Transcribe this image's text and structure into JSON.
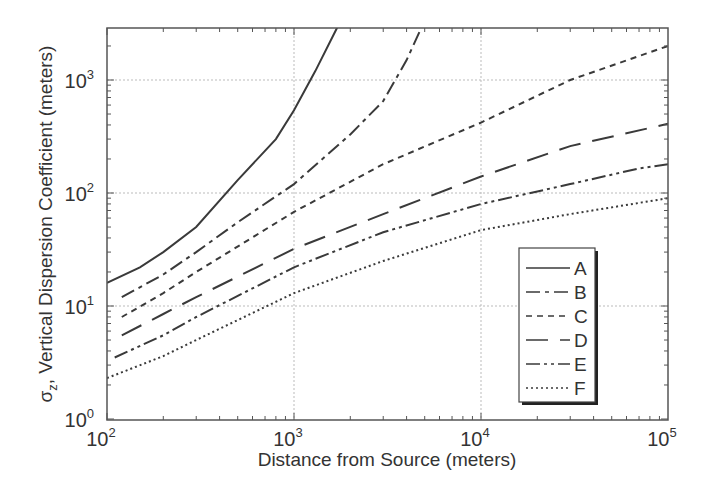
{
  "chart_data": {
    "type": "line",
    "title": "",
    "xlabel": "Distance from  Source (meters)",
    "ylabel": "σz, Vertical Dispersion Coefficient (meters)",
    "xscale": "log",
    "yscale": "log",
    "xlim": [
      100,
      100000
    ],
    "ylim": [
      1,
      2900
    ],
    "grid": true,
    "legend_position": "lower right",
    "x_ticks": [
      {
        "base": "10",
        "exp": "2",
        "value": 100
      },
      {
        "base": "10",
        "exp": "3",
        "value": 1000
      },
      {
        "base": "10",
        "exp": "4",
        "value": 10000
      },
      {
        "base": "10",
        "exp": "5",
        "value": 100000
      }
    ],
    "y_ticks": [
      {
        "base": "10",
        "exp": "0",
        "value": 1
      },
      {
        "base": "10",
        "exp": "1",
        "value": 10
      },
      {
        "base": "10",
        "exp": "2",
        "value": 100
      },
      {
        "base": "10",
        "exp": "3",
        "value": 1000
      }
    ],
    "series": [
      {
        "name": "A",
        "dash": "",
        "points": [
          [
            100,
            16
          ],
          [
            150,
            22
          ],
          [
            200,
            30
          ],
          [
            300,
            50
          ],
          [
            500,
            130
          ],
          [
            800,
            300
          ],
          [
            1000,
            540
          ],
          [
            1300,
            1200
          ],
          [
            1700,
            2900
          ]
        ]
      },
      {
        "name": "B",
        "dash": "14 5 4 5",
        "points": [
          [
            120,
            12
          ],
          [
            200,
            19
          ],
          [
            300,
            30
          ],
          [
            500,
            55
          ],
          [
            1000,
            120
          ],
          [
            2000,
            330
          ],
          [
            3000,
            650
          ],
          [
            4000,
            1500
          ],
          [
            4800,
            2900
          ]
        ]
      },
      {
        "name": "C",
        "dash": "6 5",
        "points": [
          [
            120,
            8
          ],
          [
            200,
            13
          ],
          [
            300,
            20
          ],
          [
            1000,
            68
          ],
          [
            3000,
            180
          ],
          [
            10000,
            420
          ],
          [
            30000,
            1000
          ],
          [
            100000,
            2000
          ]
        ]
      },
      {
        "name": "D",
        "dash": "22 12",
        "points": [
          [
            120,
            5.5
          ],
          [
            200,
            8.5
          ],
          [
            300,
            12
          ],
          [
            1000,
            32
          ],
          [
            3000,
            65
          ],
          [
            10000,
            140
          ],
          [
            30000,
            260
          ],
          [
            100000,
            410
          ]
        ]
      },
      {
        "name": "E",
        "dash": "14 4 3 4 3 4",
        "points": [
          [
            110,
            3.5
          ],
          [
            200,
            5.5
          ],
          [
            300,
            8
          ],
          [
            1000,
            22
          ],
          [
            3000,
            45
          ],
          [
            10000,
            80
          ],
          [
            30000,
            120
          ],
          [
            70000,
            165
          ],
          [
            100000,
            180
          ]
        ]
      },
      {
        "name": "F",
        "dash": "2 3",
        "points": [
          [
            100,
            2.3
          ],
          [
            200,
            3.6
          ],
          [
            300,
            5
          ],
          [
            1000,
            13
          ],
          [
            3000,
            25
          ],
          [
            10000,
            47
          ],
          [
            30000,
            65
          ],
          [
            100000,
            90
          ]
        ]
      }
    ]
  }
}
